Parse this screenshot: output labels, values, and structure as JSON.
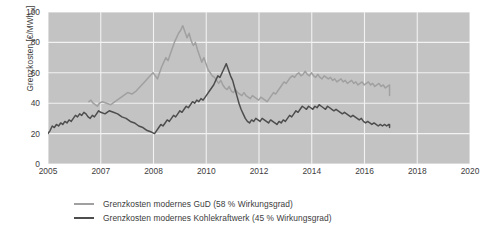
{
  "chart_data": {
    "type": "line",
    "title": "",
    "xlabel": "",
    "ylabel": "Grenzkosten [€/MWh",
    "ylabel_sub": "el",
    "ylabel_suffix": "]",
    "grid": true,
    "legend_position": "bottom",
    "xlim": [
      2005,
      2020
    ],
    "ylim": [
      0,
      100
    ],
    "x_tick_labels": [
      "2005",
      "2007",
      "2008",
      "2010",
      "2012",
      "2014",
      "2016",
      "2018",
      "2020"
    ],
    "x_tick_values": [
      2005,
      2007,
      2008,
      2010,
      2012,
      2014,
      2016,
      2018,
      2020
    ],
    "y_tick_labels": [
      "0",
      "20",
      "40",
      "60",
      "80",
      "100"
    ],
    "y_tick_values": [
      0,
      20,
      40,
      60,
      80,
      100
    ],
    "colors": {
      "plot_background": "#c3c3c3",
      "gridline": "#f2f2f2",
      "series_gud": "#a0a0a0",
      "series_kohle": "#4d4d4d",
      "text": "#3d3d3d",
      "page_background": "#ffffff"
    },
    "series": [
      {
        "name": "Grenzkosten modernes GuD (58 % Wirkungsgrad)",
        "short_name": "GuD",
        "color": "#a0a0a0",
        "efficiency_percent": 58,
        "x_start": 2006.55,
        "x_end": 2016.95,
        "x_step": 0.08,
        "values": [
          41,
          42,
          40,
          39,
          38,
          40,
          41,
          40,
          39,
          41,
          43,
          45,
          47,
          46,
          48,
          51,
          54,
          57,
          60,
          58,
          56,
          60,
          64,
          67,
          70,
          68,
          72,
          76,
          80,
          83,
          86,
          88,
          91,
          87,
          83,
          86,
          81,
          78,
          80,
          75,
          71,
          67,
          70,
          66,
          62,
          60,
          58,
          57,
          55,
          53,
          55,
          52,
          50,
          49,
          51,
          48,
          47,
          49,
          47,
          46,
          45,
          47,
          45,
          44,
          43,
          45,
          44,
          43,
          42,
          44,
          43,
          42,
          41,
          43,
          45,
          47,
          46,
          48,
          50,
          52,
          54,
          53,
          55,
          57,
          58,
          57,
          59,
          60,
          58,
          59,
          61,
          59,
          58,
          60,
          58,
          57,
          59,
          57,
          56,
          58,
          57,
          56,
          57,
          55,
          56,
          54,
          55,
          56,
          54,
          55,
          53,
          54,
          55,
          53,
          54,
          52,
          53,
          54,
          52,
          53,
          54,
          52,
          53,
          51,
          52,
          53,
          51,
          52,
          50,
          51,
          52,
          50,
          49,
          50,
          48,
          49,
          47,
          48,
          46,
          47,
          45,
          46,
          45,
          45,
          45,
          45,
          45,
          45,
          45,
          45,
          45,
          45,
          45,
          45,
          45,
          45,
          45,
          45,
          45,
          45,
          45,
          45,
          45,
          45,
          45,
          45,
          45,
          45,
          45,
          45,
          45,
          45,
          45,
          45,
          45,
          45,
          45,
          45,
          45,
          45,
          45,
          45,
          45,
          45,
          45,
          45,
          45,
          45,
          45,
          45,
          45,
          45
        ]
      },
      {
        "name": "Grenzkosten modernes Kohlekraftwerk (45 % Wirkungsgrad)",
        "short_name": "Kohlekraftwerk",
        "color": "#4d4d4d",
        "efficiency_percent": 45,
        "x_start": 2005.0,
        "x_end": 2016.95,
        "x_step": 0.08,
        "values": [
          20,
          22,
          25,
          24,
          26,
          25,
          27,
          26,
          28,
          27,
          29,
          28,
          30,
          32,
          31,
          33,
          32,
          34,
          33,
          31,
          30,
          32,
          31,
          33,
          35,
          34,
          33,
          35,
          34,
          33,
          31,
          30,
          28,
          27,
          25,
          24,
          22,
          21,
          20,
          22,
          24,
          26,
          25,
          27,
          29,
          28,
          30,
          32,
          31,
          33,
          35,
          34,
          36,
          38,
          37,
          39,
          41,
          40,
          42,
          41,
          43,
          42,
          44,
          46,
          48,
          50,
          52,
          55,
          58,
          57,
          60,
          63,
          66,
          62,
          58,
          55,
          50,
          45,
          40,
          36,
          33,
          30,
          28,
          27,
          29,
          28,
          30,
          29,
          28,
          30,
          29,
          28,
          27,
          29,
          28,
          27,
          26,
          28,
          27,
          29,
          28,
          30,
          32,
          31,
          33,
          35,
          34,
          36,
          38,
          37,
          36,
          38,
          37,
          36,
          38,
          37,
          39,
          38,
          37,
          36,
          38,
          37,
          36,
          35,
          36,
          35,
          34,
          33,
          34,
          33,
          32,
          31,
          32,
          31,
          30,
          29,
          30,
          28,
          27,
          28,
          27,
          26,
          27,
          26,
          25,
          26,
          25,
          26,
          25,
          26,
          25,
          24,
          25,
          26,
          25,
          24,
          25,
          24,
          25,
          24,
          25,
          24,
          24,
          24,
          24,
          24,
          24,
          24,
          24,
          24,
          24,
          24,
          24,
          24,
          24,
          24,
          24,
          24,
          24,
          24,
          25,
          25,
          25,
          25,
          25,
          25,
          25,
          25,
          25,
          25,
          25,
          25
        ]
      }
    ]
  },
  "legend": {
    "items": [
      {
        "label": "Grenzkosten modernes GuD (58 % Wirkungsgrad)",
        "color": "#a0a0a0"
      },
      {
        "label": "Grenzkosten modernes Kohlekraftwerk (45 % Wirkungsgrad)",
        "color": "#4d4d4d"
      }
    ]
  }
}
